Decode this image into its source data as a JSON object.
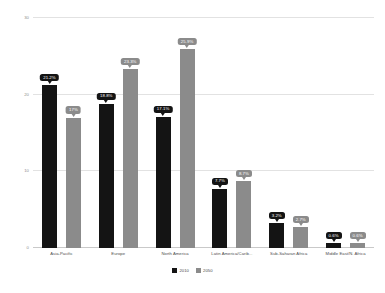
{
  "chart_data": {
    "type": "bar",
    "title": "",
    "subtitle": "",
    "xlabel": "",
    "ylabel": "",
    "ylim": [
      0,
      30
    ],
    "yticks": [
      0,
      10,
      20,
      30
    ],
    "ytick_labels": [
      "0",
      "10",
      "20",
      "30"
    ],
    "grid": true,
    "legend_position": "bottom",
    "categories": [
      "Asia-Pacific",
      "Europe",
      "North America",
      "Latin America/Carib...",
      "Sub-Saharan Africa",
      "Middle East/N. Africa"
    ],
    "series": [
      {
        "name": "2010",
        "color": "#141414",
        "values": [
          21.2,
          18.8,
          17.1,
          7.7,
          3.2,
          0.6
        ],
        "labels": [
          "21.2%",
          "18.8%",
          "17.1%",
          "7.7%",
          "3.2%",
          "0.6%"
        ]
      },
      {
        "name": "2050",
        "color": "#8b8b8b",
        "values": [
          17.0,
          23.3,
          25.9,
          8.7,
          2.7,
          0.6
        ],
        "labels": [
          "17%",
          "23.3%",
          "25.9%",
          "8.7%",
          "2.7%",
          "0.6%"
        ]
      }
    ]
  },
  "legend": {
    "items": [
      {
        "label": "2010",
        "color": "#141414"
      },
      {
        "label": "2050",
        "color": "#8b8b8b"
      }
    ]
  },
  "colors": {
    "series_2010": "#141414",
    "series_2050": "#8b8b8b",
    "gridline": "#e2e2e2",
    "axis": "#c9c9c9",
    "tick_text": "#8d8d8d",
    "category_text": "#4c4c4c",
    "background": "#ffffff"
  }
}
